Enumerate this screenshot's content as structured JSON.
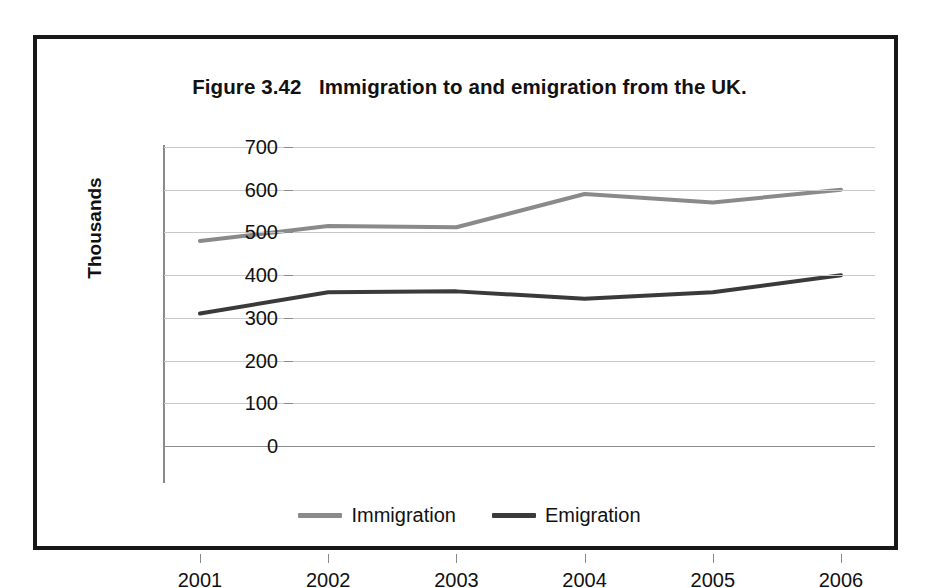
{
  "figure": {
    "title": "Figure 3.42   Immigration to and emigration from the UK.",
    "frame_color": "#181818",
    "background": "#ffffff"
  },
  "chart_data": {
    "type": "line",
    "title": "Figure 3.42   Immigration to and emigration from the UK.",
    "categories": [
      "2001",
      "2002",
      "2003",
      "2004",
      "2005",
      "2006"
    ],
    "x": [
      2001,
      2002,
      2003,
      2004,
      2005,
      2006
    ],
    "series": [
      {
        "name": "Immigration",
        "color": "#8a8a8a",
        "values": [
          480,
          515,
          512,
          590,
          570,
          600
        ]
      },
      {
        "name": "Emigration",
        "color": "#3a3a3a",
        "values": [
          310,
          360,
          362,
          345,
          360,
          400
        ]
      }
    ],
    "xlabel": "",
    "ylabel": "Thousands",
    "ylim": [
      0,
      700
    ],
    "ytick_values": [
      700,
      600,
      500,
      400,
      300,
      200,
      100,
      0
    ],
    "ytick_labels": [
      "700",
      "600",
      "500",
      "400",
      "300",
      "200",
      "100",
      "0"
    ],
    "xtick_labels": [
      "2001",
      "2002",
      "2003",
      "2004",
      "2005",
      "2006"
    ],
    "grid": true,
    "grid_color": "#c9c9c9",
    "legend_position": "bottom-center",
    "legend_entries": [
      "Immigration",
      "Emigration"
    ]
  },
  "axes": {
    "y_title": "Thousands",
    "y_ticks": [
      "700",
      "600",
      "500",
      "400",
      "300",
      "200",
      "100",
      "0"
    ],
    "x_ticks": [
      "2001",
      "2002",
      "2003",
      "2004",
      "2005",
      "2006"
    ]
  },
  "legend": {
    "items": [
      {
        "label": "Immigration",
        "color": "#8a8a8a"
      },
      {
        "label": "Emigration",
        "color": "#3a3a3a"
      }
    ]
  }
}
